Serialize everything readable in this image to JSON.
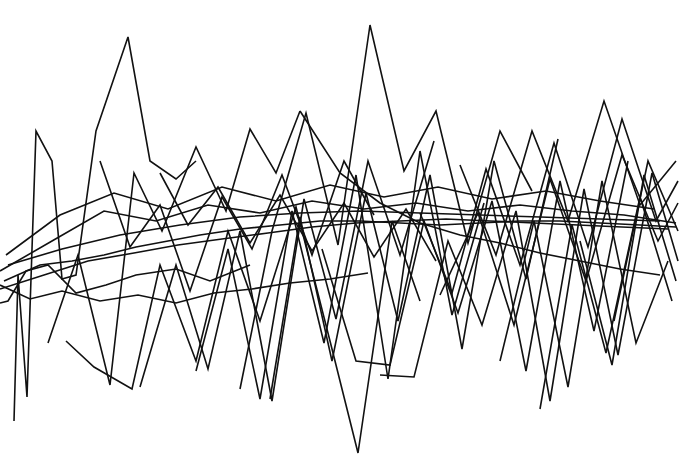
{
  "figure": {
    "title": "",
    "background_color": "#ffffff",
    "width": 681,
    "height": 461
  },
  "chart_data": {
    "type": "line",
    "title": "",
    "subtitle": "",
    "xlabel": "",
    "ylabel": "",
    "xlim": [
      0,
      681
    ],
    "ylim": [
      461,
      0
    ],
    "grid": false,
    "axes_visible": false,
    "tick_labels_visible": false,
    "legend": false,
    "legend_position": "none",
    "annotations": [],
    "stroke_color": "#111111",
    "stroke_width": 1.6,
    "series_count": 26,
    "note": "Dense overlapping polyline (spaghetti) plot; y values are in pixel coordinates with origin at top-left.",
    "series": [
      {
        "name": "series-01",
        "x": [
          14,
          18,
          27,
          36,
          52,
          62,
          76,
          96,
          128,
          150,
          176,
          196
        ],
        "values": [
          40,
          186,
          64,
          330,
          300,
          182,
          186,
          330,
          424,
          300,
          282,
          300
        ]
      },
      {
        "name": "series-02",
        "x": [
          0,
          8,
          26,
          48,
          76,
          106,
          136,
          176,
          210,
          250
        ],
        "values": [
          158,
          160,
          190,
          196,
          168,
          176,
          186,
          192,
          180,
          196
        ]
      },
      {
        "name": "series-03",
        "x": [
          0,
          30,
          62,
          100,
          138,
          176,
          214,
          252,
          290,
          330,
          368
        ],
        "values": [
          176,
          162,
          170,
          160,
          166,
          158,
          168,
          172,
          178,
          182,
          188
        ]
      },
      {
        "name": "series-04",
        "x": [
          4,
          40,
          72,
          104,
          136,
          168,
          200,
          240,
          280,
          320,
          360,
          400,
          440,
          480,
          520,
          560,
          600,
          640,
          676
        ],
        "values": [
          180,
          196,
          200,
          206,
          214,
          220,
          226,
          232,
          236,
          240,
          240,
          238,
          236,
          238,
          240,
          240,
          238,
          236,
          234
        ]
      },
      {
        "name": "series-05",
        "x": [
          8,
          62,
          120,
          180,
          240,
          300,
          360,
          420,
          480,
          540,
          600,
          660
        ],
        "values": [
          196,
          212,
          226,
          236,
          244,
          248,
          250,
          248,
          246,
          244,
          242,
          240
        ]
      },
      {
        "name": "series-06",
        "x": [
          0,
          44,
          88,
          134,
          178,
          222,
          268,
          312,
          356,
          400,
          446,
          490,
          534,
          578,
          622,
          668
        ],
        "values": [
          172,
          186,
          200,
          208,
          216,
          222,
          228,
          234,
          238,
          240,
          242,
          240,
          238,
          236,
          234,
          232
        ]
      },
      {
        "name": "series-07",
        "x": [
          48,
          78,
          110,
          134,
          162,
          196,
          226,
          250,
          276,
          300
        ],
        "values": [
          118,
          206,
          76,
          288,
          230,
          314,
          250,
          332,
          288,
          350
        ]
      },
      {
        "name": "series-08",
        "x": [
          66,
          94,
          132,
          160,
          196,
          228,
          260,
          296,
          330,
          358,
          392,
          420
        ],
        "values": [
          120,
          94,
          72,
          196,
          100,
          230,
          140,
          254,
          120,
          8,
          240,
          160
        ]
      },
      {
        "name": "series-09",
        "x": [
          100,
          130,
          160,
          190,
          222,
          252,
          282,
          312,
          344,
          374
        ],
        "values": [
          300,
          214,
          256,
          170,
          264,
          212,
          286,
          206,
          300,
          246
        ]
      },
      {
        "name": "series-10",
        "x": [
          140,
          176,
          208,
          240,
          272,
          304,
          336,
          368,
          400,
          434
        ],
        "values": [
          74,
          196,
          92,
          230,
          60,
          262,
          142,
          300,
          206,
          320
        ]
      },
      {
        "name": "series-11",
        "x": [
          0,
          52,
          104,
          156,
          208,
          260,
          312,
          364,
          416,
          468,
          520,
          572,
          624,
          676
        ],
        "values": [
          190,
          220,
          250,
          240,
          256,
          248,
          260,
          252,
          258,
          250,
          256,
          250,
          246,
          238
        ]
      },
      {
        "name": "series-12",
        "x": [
          6,
          60,
          114,
          168,
          222,
          276,
          330,
          384,
          438,
          492,
          546,
          600,
          654
        ],
        "values": [
          206,
          246,
          268,
          252,
          274,
          260,
          276,
          264,
          274,
          262,
          270,
          260,
          252
        ]
      },
      {
        "name": "series-13",
        "x": [
          160,
          188,
          218,
          250,
          280,
          312,
          344,
          374,
          406,
          436
        ],
        "values": [
          288,
          236,
          274,
          218,
          266,
          210,
          258,
          204,
          252,
          200
        ]
      },
      {
        "name": "series-14",
        "x": [
          196,
          228,
          260,
          292,
          324,
          356,
          388,
          420,
          452,
          484
        ],
        "values": [
          90,
          212,
          62,
          250,
          118,
          286,
          82,
          310,
          146,
          258
        ]
      },
      {
        "name": "series-15",
        "x": [
          240,
          272,
          306,
          338,
          370,
          404,
          436,
          468,
          500,
          532
        ],
        "values": [
          72,
          230,
          348,
          216,
          436,
          290,
          350,
          218,
          330,
          270
        ]
      },
      {
        "name": "series-16",
        "x": [
          270,
          300,
          332,
          366,
          398,
          430,
          462,
          494,
          526,
          558
        ],
        "values": [
          62,
          244,
          100,
          268,
          140,
          286,
          112,
          300,
          182,
          322
        ]
      },
      {
        "name": "series-17",
        "x": [
          300,
          340,
          380,
          420,
          460,
          500,
          540,
          580,
          620,
          660
        ],
        "values": [
          350,
          288,
          258,
          238,
          226,
          218,
          208,
          200,
          192,
          186
        ]
      },
      {
        "name": "series-18",
        "x": [
          322,
          356,
          390,
          424,
          458,
          492,
          526,
          560,
          594,
          628
        ],
        "values": [
          212,
          100,
          96,
          240,
          148,
          260,
          90,
          280,
          130,
          300
        ]
      },
      {
        "name": "series-19",
        "x": [
          380,
          414,
          448,
          482,
          516,
          550,
          584,
          618,
          652,
          678
        ],
        "values": [
          86,
          84,
          220,
          136,
          250,
          60,
          272,
          106,
          288,
          200
        ]
      },
      {
        "name": "series-20",
        "x": [
          420,
          452,
          486,
          520,
          554,
          588,
          622,
          656,
          678
        ],
        "values": [
          248,
          168,
          292,
          196,
          318,
          214,
          342,
          240,
          280
        ]
      },
      {
        "name": "series-21",
        "x": [
          440,
          478,
          514,
          550,
          586,
          622,
          658,
          678
        ],
        "values": [
          166,
          248,
          136,
          282,
          180,
          306,
          220,
          258
        ]
      },
      {
        "name": "series-22",
        "x": [
          460,
          496,
          532,
          568,
          604,
          640,
          676
        ],
        "values": [
          296,
          206,
          330,
          240,
          360,
          256,
          300
        ]
      },
      {
        "name": "series-23",
        "x": [
          500,
          534,
          568,
          602,
          636,
          668
        ],
        "values": [
          100,
          240,
          74,
          280,
          118,
          200
        ]
      },
      {
        "name": "series-24",
        "x": [
          540,
          572,
          606,
          640,
          672
        ],
        "values": [
          52,
          236,
          108,
          264,
          160
        ]
      },
      {
        "name": "series-25",
        "x": [
          580,
          612,
          644,
          676
        ],
        "values": [
          220,
          96,
          286,
          180
        ]
      },
      {
        "name": "series-26",
        "x": [
          614,
          648,
          678
        ],
        "values": [
          140,
          300,
          230
        ]
      }
    ]
  }
}
